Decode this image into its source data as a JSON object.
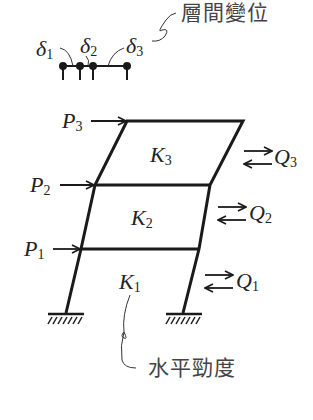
{
  "annotations": {
    "story_drift": "層間變位",
    "lateral_stiffness": "水平勁度"
  },
  "drifts": [
    {
      "symbol": "δ",
      "index": "1"
    },
    {
      "symbol": "δ",
      "index": "2"
    },
    {
      "symbol": "δ",
      "index": "3"
    }
  ],
  "loads": [
    {
      "symbol": "P",
      "index": "3"
    },
    {
      "symbol": "P",
      "index": "2"
    },
    {
      "symbol": "P",
      "index": "1"
    }
  ],
  "stiffness": [
    {
      "symbol": "K",
      "index": "3"
    },
    {
      "symbol": "K",
      "index": "2"
    },
    {
      "symbol": "K",
      "index": "1"
    }
  ],
  "shears": [
    {
      "symbol": "Q",
      "index": "3"
    },
    {
      "symbol": "Q",
      "index": "2"
    },
    {
      "symbol": "Q",
      "index": "1"
    }
  ],
  "colors": {
    "line": "#1a1a1a",
    "text": "#333333"
  }
}
